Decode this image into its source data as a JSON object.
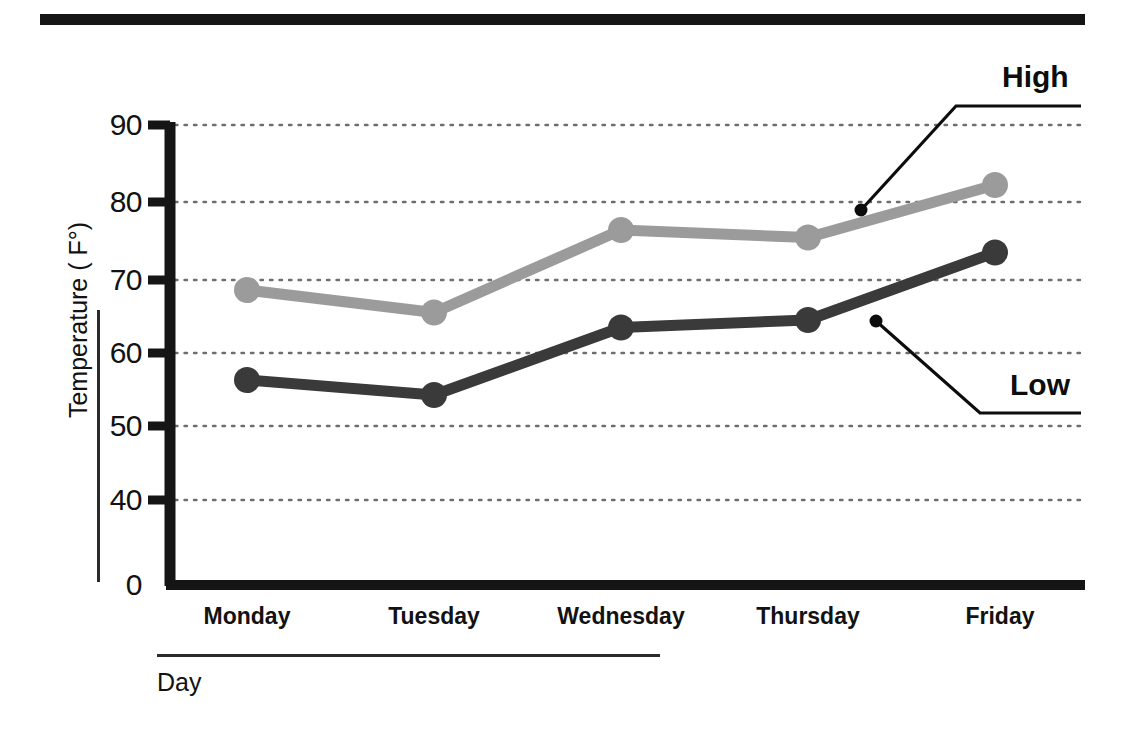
{
  "chart_data": {
    "type": "line",
    "title": "",
    "xlabel": "Day",
    "ylabel": "Temperature ( F°)",
    "categories": [
      "Monday",
      "Tuesday",
      "Wednesday",
      "Thursday",
      "Friday"
    ],
    "ylim": [
      0,
      90
    ],
    "yticks": [
      90,
      80,
      70,
      60,
      50,
      40,
      0
    ],
    "grid": true,
    "grid_style": "dotted-horizontal",
    "legend": "inline-annotations",
    "series": [
      {
        "name": "High",
        "color": "#9b9b9b",
        "values": [
          68,
          65,
          76,
          75,
          82
        ]
      },
      {
        "name": "Low",
        "color": "#3a3a3a",
        "values": [
          56,
          54,
          63,
          64,
          73
        ]
      }
    ]
  },
  "axis": {
    "y_tick_labels": [
      "90",
      "80",
      "70",
      "60",
      "50",
      "40",
      "0"
    ],
    "x_tick_labels": [
      "Monday",
      "Tuesday",
      "Wednesday",
      "Thursday",
      "Friday"
    ],
    "y_title": "Temperature ( F°)",
    "x_title": "Day"
  },
  "annotations": {
    "high_label": "High",
    "low_label": "Low"
  },
  "colors": {
    "high_series": "#9b9b9b",
    "low_series": "#3a3a3a",
    "axis": "#151515",
    "grid": "#6e6e6e",
    "text": "#121212"
  }
}
